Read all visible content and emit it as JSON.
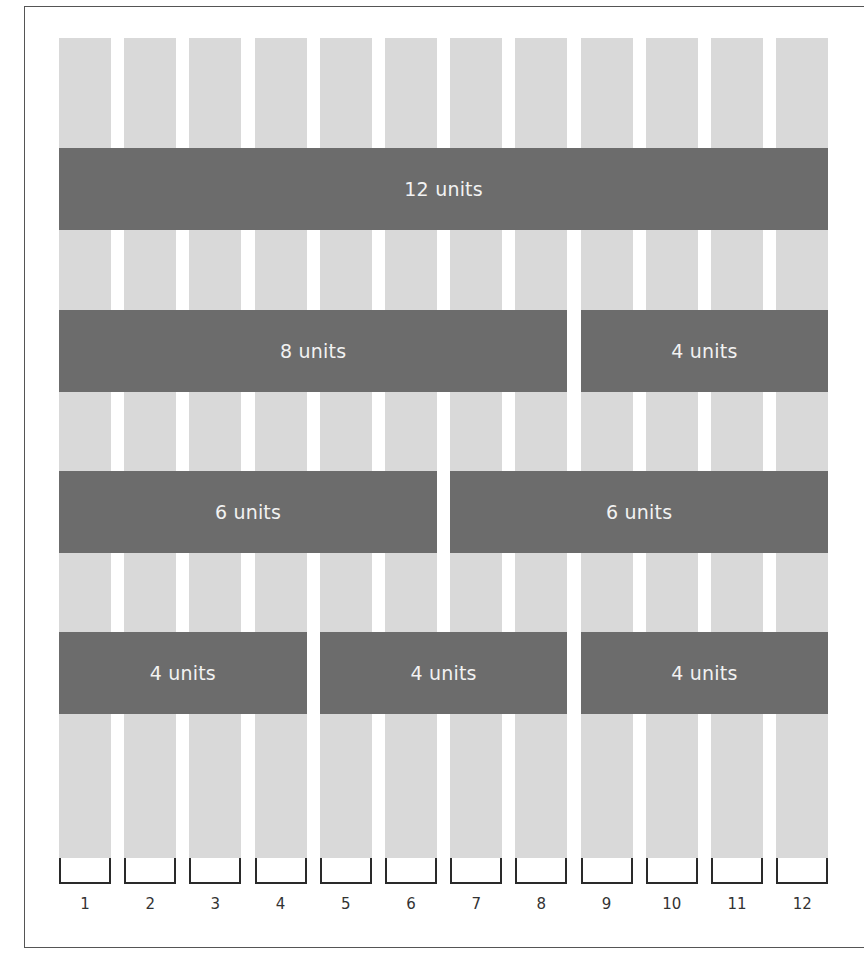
{
  "diagram": {
    "column_count": 12,
    "column_labels": [
      "1",
      "2",
      "3",
      "4",
      "5",
      "6",
      "7",
      "8",
      "9",
      "10",
      "11",
      "12"
    ],
    "colors": {
      "column": "#d9d9d9",
      "band": "#6c6c6c",
      "band_text": "#f2f2f2",
      "frame": "#555555"
    },
    "rows": [
      {
        "spans": [
          {
            "label": "12 units",
            "start": 1,
            "units": 12
          }
        ]
      },
      {
        "spans": [
          {
            "label": "8 units",
            "start": 1,
            "units": 8
          },
          {
            "label": "4 units",
            "start": 9,
            "units": 4
          }
        ]
      },
      {
        "spans": [
          {
            "label": "6 units",
            "start": 1,
            "units": 6
          },
          {
            "label": "6 units",
            "start": 7,
            "units": 6
          }
        ]
      },
      {
        "spans": [
          {
            "label": "4 units",
            "start": 1,
            "units": 4
          },
          {
            "label": "4 units",
            "start": 5,
            "units": 4
          },
          {
            "label": "4 units",
            "start": 9,
            "units": 4
          }
        ]
      }
    ]
  }
}
